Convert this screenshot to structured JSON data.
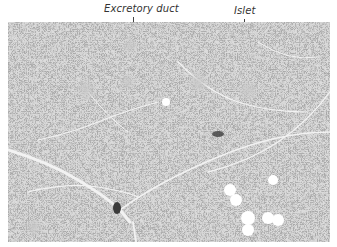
{
  "figure": {
    "labels": [
      {
        "id": "excretory-duct",
        "text": "Excretory duct"
      },
      {
        "id": "islet",
        "text": "Islet"
      }
    ],
    "colors": {
      "tissue_dark": "#6e6e6e",
      "tissue_mid": "#9a9a9a",
      "septa": "#eeeeee",
      "background": "#ffffff",
      "label_text": "#333333"
    }
  }
}
